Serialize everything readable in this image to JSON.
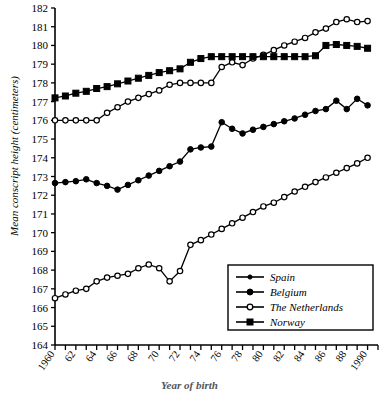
{
  "figure": {
    "ylabel": "Mean conscript height (centimeters)",
    "xtitle": "Year of birth"
  },
  "chart_data": {
    "type": "line",
    "title": "",
    "xlabel": "Year of birth",
    "ylabel": "Mean conscript height (centimeters)",
    "xlim": [
      1960,
      1991
    ],
    "ylim": [
      164,
      182
    ],
    "ytick_step": 1,
    "xtick_step": 1,
    "grid": false,
    "legend_position": "lower-right",
    "ytick_labels": [
      "164",
      "165",
      "166",
      "167",
      "168",
      "169",
      "170",
      "171",
      "172",
      "173",
      "174",
      "175",
      "176",
      "177",
      "178",
      "179",
      "180",
      "181",
      "182"
    ],
    "xtick_labels": [
      "1960",
      "62",
      "64",
      "66",
      "68",
      "70",
      "72",
      "74",
      "76",
      "78",
      "80",
      "82",
      "84",
      "86",
      "88",
      "1990"
    ],
    "x": [
      1960,
      1961,
      1962,
      1963,
      1964,
      1965,
      1966,
      1967,
      1968,
      1969,
      1970,
      1971,
      1972,
      1973,
      1974,
      1975,
      1976,
      1977,
      1978,
      1979,
      1980,
      1981,
      1982,
      1983,
      1984,
      1985,
      1986,
      1987,
      1988,
      1989,
      1990
    ],
    "series": [
      {
        "name": "Spain",
        "marker": "open-circle",
        "color": "#000000",
        "values": [
          166.5,
          166.7,
          166.9,
          167.0,
          167.4,
          167.6,
          167.7,
          167.8,
          168.1,
          168.3,
          168.1,
          167.4,
          167.95,
          169.35,
          169.6,
          169.9,
          170.2,
          170.5,
          170.8,
          171.1,
          171.4,
          171.6,
          171.9,
          172.2,
          172.45,
          172.7,
          172.95,
          173.2,
          173.45,
          173.7,
          174.0
        ]
      },
      {
        "name": "Belgium",
        "marker": "filled-circle",
        "color": "#000000",
        "values": [
          172.65,
          172.7,
          172.75,
          172.85,
          172.65,
          172.5,
          172.3,
          172.55,
          172.8,
          173.05,
          173.3,
          173.55,
          173.8,
          174.45,
          174.55,
          174.6,
          175.9,
          175.55,
          175.3,
          175.5,
          175.65,
          175.8,
          175.95,
          176.1,
          176.3,
          176.5,
          176.6,
          177.05,
          176.6,
          177.15,
          176.8
        ]
      },
      {
        "name": "The Netherlands",
        "marker": "open-circle",
        "color": "#000000",
        "values": [
          176.0,
          176.0,
          176.0,
          176.0,
          176.0,
          176.4,
          176.7,
          177.0,
          177.2,
          177.4,
          177.6,
          177.9,
          178.0,
          178.0,
          178.0,
          178.0,
          178.85,
          179.1,
          178.95,
          179.3,
          179.5,
          179.75,
          180.0,
          180.2,
          180.4,
          180.7,
          180.9,
          181.25,
          181.4,
          181.25,
          181.3
        ]
      },
      {
        "name": "Norway",
        "marker": "filled-square",
        "color": "#000000",
        "values": [
          177.2,
          177.3,
          177.45,
          177.55,
          177.7,
          177.8,
          177.95,
          178.1,
          178.25,
          178.4,
          178.55,
          178.65,
          178.75,
          179.1,
          179.3,
          179.4,
          179.4,
          179.4,
          179.4,
          179.4,
          179.4,
          179.4,
          179.4,
          179.4,
          179.4,
          179.45,
          180.0,
          180.05,
          180.0,
          179.95,
          179.85
        ]
      }
    ]
  },
  "legend": {
    "entries": [
      {
        "label": "Spain",
        "marker": "filled-circle-small"
      },
      {
        "label": "Belgium",
        "marker": "filled-circle"
      },
      {
        "label": "The Netherlands",
        "marker": "open-circle"
      },
      {
        "label": "Norway",
        "marker": "filled-square"
      }
    ]
  }
}
